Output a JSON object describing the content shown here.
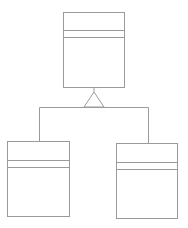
{
  "diagram": {
    "type": "uml-class-inheritance",
    "stroke_color": "#9a9a9a",
    "background": "#ffffff",
    "classes": [
      {
        "id": "parent",
        "name": "",
        "attributes": [],
        "methods": [],
        "x": 63,
        "y": 12,
        "w": 61,
        "h": 75,
        "div1": 30,
        "div2": 37
      },
      {
        "id": "child-left",
        "name": "",
        "attributes": [],
        "methods": [],
        "x": 7,
        "y": 141,
        "w": 62,
        "h": 75,
        "div1": 160,
        "div2": 167
      },
      {
        "id": "child-right",
        "name": "",
        "attributes": [],
        "methods": [],
        "x": 116,
        "y": 143,
        "w": 61,
        "h": 75,
        "div1": 162,
        "div2": 169
      }
    ],
    "relationship": {
      "kind": "generalization",
      "arrow": "hollow-triangle"
    }
  }
}
